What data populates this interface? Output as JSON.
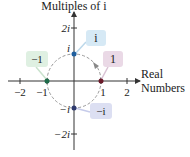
{
  "title": "Multiples of i",
  "x_axis_label": [
    "Real",
    "Numbers"
  ],
  "x_ticks": [
    "−2",
    "−1",
    "1",
    "2"
  ],
  "y_ticks": [
    "2i",
    "i",
    "−i",
    "−2i"
  ],
  "callouts": {
    "i": {
      "label": "i",
      "color": "#d6e9f5",
      "dot": "#1f5f9e"
    },
    "one": {
      "label": "1",
      "color": "#ead9e6",
      "dot": "#6b1a2a"
    },
    "neg_one": {
      "label": "−1",
      "color": "#dff0e2",
      "dot": "#1e6b4a"
    },
    "neg_i": {
      "label": "−i",
      "color": "#dcdff2",
      "dot": "#2e3a6e"
    }
  }
}
